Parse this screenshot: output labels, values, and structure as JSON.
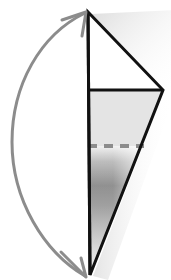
{
  "figure": {
    "title": "Funnel cross-section with sediment gradient and double-headed curved arrow",
    "canvas": {
      "width": 171,
      "height": 280,
      "background": "#ffffff"
    },
    "colors": {
      "outline": "#111111",
      "arrow": "#8c8c8c",
      "dashed_line": "#8c8c8c",
      "upper_fill": "#ffffff",
      "supernatant_fill": "#e4e4e4",
      "gradient_dark": "#6e6e6e",
      "gradient_light": "#f2f2f2",
      "drop_shadow": "#d8d8d8"
    },
    "geometry": {
      "apex_top": {
        "x": 88,
        "y": 12
      },
      "vertex_right": {
        "x": 163,
        "y": 90
      },
      "vertex_bottom": {
        "x": 90,
        "y": 275
      },
      "axis_top": {
        "x": 88,
        "y": 12
      },
      "axis_bottom": {
        "x": 90,
        "y": 275
      },
      "horizontal_line_y": 90,
      "horizontal_line_x1": 88,
      "horizontal_line_x2": 163,
      "dashed_line_y": 146,
      "dashed_line_x1": 88,
      "dashed_line_x2": 143,
      "outline_stroke_width": 3,
      "dashed_stroke_width": 4,
      "dash_pattern": "9 7"
    },
    "arrow": {
      "label": "double-headed-curved-arrow",
      "stroke_width": 3,
      "head_length": 16,
      "path": "M 85,13 C 40,35 12,85 12,142 C 12,200 44,252 85,276",
      "top_head": {
        "tip_x": 85,
        "tip_y": 13
      },
      "bottom_head": {
        "tip_x": 85,
        "tip_y": 276
      }
    },
    "regions": [
      {
        "name": "upper-triangle",
        "fill": "#ffffff",
        "description": "unfilled headspace triangle above horizontal line"
      },
      {
        "name": "supernatant-band",
        "fill": "#e4e4e4",
        "description": "uniform light gray band between solid line and dashed line"
      },
      {
        "name": "sediment-gradient",
        "fill": "gradient",
        "description": "vertical gray gradient fading toward the bottom tip"
      }
    ]
  }
}
